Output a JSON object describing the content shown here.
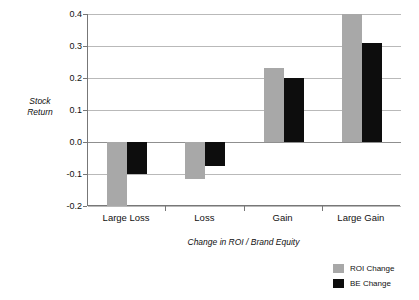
{
  "chart_data": {
    "type": "bar",
    "title": "",
    "xlabel": "Change in ROI / Brand Equity",
    "ylabel": "Stock Return",
    "ylabel_lines": [
      "Stock",
      "Return"
    ],
    "categories": [
      "Large Loss",
      "Loss",
      "Gain",
      "Large Gain"
    ],
    "series": [
      {
        "name": "ROI Change",
        "color": "#a8a8a8",
        "values": [
          -0.2,
          -0.115,
          0.23,
          0.4
        ]
      },
      {
        "name": "BE Change",
        "color": "#0d0d0d",
        "values": [
          -0.1,
          -0.075,
          0.2,
          0.31
        ]
      }
    ],
    "ylim": [
      -0.2,
      0.4
    ],
    "ytick_labels": [
      "0.4",
      "0.3",
      "0.2",
      "0.1",
      "0.0",
      "-0.1",
      "-0.2"
    ],
    "ytick_values": [
      0.4,
      0.3,
      0.2,
      0.1,
      0.0,
      -0.1,
      -0.2
    ],
    "grid": true,
    "legend_position": "bottom-right",
    "legend": [
      "ROI Change",
      "BE Change"
    ]
  },
  "axis": {
    "y_title_line1": "Stock",
    "y_title_line2": "Return",
    "x_title": "Change in ROI / Brand Equity"
  },
  "ticks": {
    "y": [
      "0.4",
      "0.3",
      "0.2",
      "0.1",
      "0.0",
      "-0.1",
      "-0.2"
    ],
    "x": [
      "Large Loss",
      "Loss",
      "Gain",
      "Large Gain"
    ]
  },
  "legend": {
    "items": [
      {
        "label": "ROI Change",
        "color": "#a8a8a8"
      },
      {
        "label": "BE Change",
        "color": "#0d0d0d"
      }
    ]
  }
}
